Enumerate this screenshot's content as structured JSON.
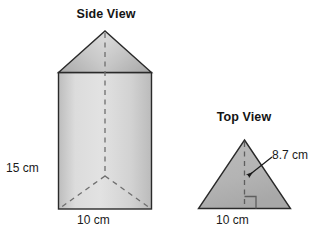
{
  "figure": {
    "kind": "geometry-diagram",
    "background_color": "#ffffff",
    "outline_color": "#1a1a1a",
    "fill_color_light": "#d8d8d8",
    "fill_color_mid": "#c2c2c2",
    "fill_color_dark": "#b2b2b2",
    "dashed_color": "#6e6e6e",
    "text_color": "#141414"
  },
  "side_view": {
    "title": "Side View",
    "height_label": "15 cm",
    "base_label": "10 cm"
  },
  "top_view": {
    "title": "Top View",
    "base_label": "10 cm",
    "altitude_label": "8.7 cm"
  }
}
